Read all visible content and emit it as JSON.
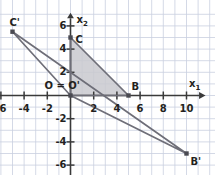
{
  "figure": {
    "kind": "coordinate-plane-geometry",
    "background": "#ffffff",
    "grid_color": "#c9cfe0",
    "axis_color": "#3a3a3a",
    "shape_color": "#6e6e78",
    "fill_color": "#c9c9cf",
    "label_color": "#231f20"
  },
  "axes": {
    "x_label": "x",
    "x_label_sub": "1",
    "y_label": "x",
    "y_label_sub": "2",
    "x_ticks": [
      {
        "value": -6,
        "label": "-6"
      },
      {
        "value": -4,
        "label": "-4"
      },
      {
        "value": -2,
        "label": "-2"
      },
      {
        "value": 2,
        "label": "2"
      },
      {
        "value": 4,
        "label": "4"
      },
      {
        "value": 6,
        "label": "6"
      },
      {
        "value": 8,
        "label": "8"
      },
      {
        "value": 10,
        "label": "10"
      }
    ],
    "y_ticks": [
      {
        "value": 6,
        "label": "6"
      },
      {
        "value": 4,
        "label": "4"
      },
      {
        "value": 2,
        "label": "2"
      },
      {
        "value": -2,
        "label": "-2"
      },
      {
        "value": -4,
        "label": "-4"
      },
      {
        "value": -6,
        "label": "-6"
      }
    ],
    "x_range": [
      -7.2,
      11.6
    ],
    "y_range": [
      -7.2,
      7.0
    ]
  },
  "points": [
    {
      "id": "O",
      "label": "O = O'",
      "x": 0,
      "y": 0,
      "marker": true
    },
    {
      "id": "B",
      "label": "B",
      "x": 5,
      "y": 0,
      "marker": true
    },
    {
      "id": "C",
      "label": "C",
      "x": 0,
      "y": 5,
      "marker": true
    },
    {
      "id": "Bp",
      "label": "B'",
      "x": 10,
      "y": -5,
      "marker": true
    },
    {
      "id": "Cp",
      "label": "C'",
      "x": -5,
      "y": 5.5,
      "marker": true
    }
  ],
  "shapes": [
    {
      "name": "triangle-OBC",
      "vertices": [
        "O",
        "B",
        "C"
      ],
      "filled": true
    },
    {
      "name": "triangle-OBpCp",
      "vertices": [
        "O",
        "Bp",
        "Cp"
      ],
      "filled": false
    }
  ]
}
